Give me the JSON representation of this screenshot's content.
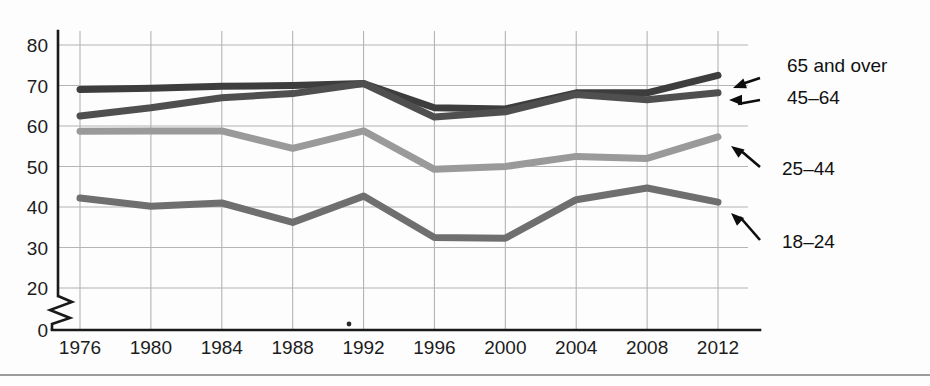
{
  "figure": {
    "background_color": "#fdfdfd",
    "bottom_rule_color": "#7b7b7b"
  },
  "chart_data": {
    "type": "line",
    "title": "",
    "subtitle": "",
    "xlabel": "",
    "ylabel": "",
    "x": [
      1976,
      1980,
      1984,
      1988,
      1992,
      1996,
      2000,
      2004,
      2008,
      2012
    ],
    "categories": [
      "1976",
      "1980",
      "1984",
      "1988",
      "1992",
      "1996",
      "2000",
      "2004",
      "2008",
      "2012"
    ],
    "xlim": [
      1976,
      2012
    ],
    "ylim": [
      0,
      80
    ],
    "y_ticks": [
      "0",
      "20",
      "30",
      "40",
      "50",
      "60",
      "70",
      "80"
    ],
    "y_tick_values": [
      0,
      20,
      30,
      40,
      50,
      60,
      70,
      80
    ],
    "y_axis_break": true,
    "y_axis_break_between": [
      0,
      20
    ],
    "grid": true,
    "legend_position": "right-annotations",
    "series": [
      {
        "name": "65 and over",
        "label": "65 and over",
        "color": "#3d3d3d",
        "values": [
          69,
          69.3,
          69.8,
          70.0,
          70.5,
          64.5,
          64.2,
          68.2,
          68.2,
          72.5
        ]
      },
      {
        "name": "45-64",
        "label": "45–64",
        "color": "#4f4f4f",
        "values": [
          62.5,
          64.5,
          67,
          68,
          70.5,
          62.2,
          63.5,
          67.8,
          66.5,
          68.2
        ]
      },
      {
        "name": "25-44",
        "label": "25–44",
        "color": "#9a9a9a",
        "values": [
          58.7,
          58.8,
          58.8,
          54.5,
          58.8,
          49.3,
          50,
          52.5,
          52,
          57.3
        ]
      },
      {
        "name": "18-24",
        "label": "18–24",
        "color": "#6f6f6f",
        "values": [
          42.2,
          40.2,
          41,
          36.2,
          42.7,
          32.5,
          32.3,
          41.8,
          44.7,
          41.2
        ]
      }
    ]
  },
  "annotations": [
    {
      "name": "65 and over",
      "text": "65 and over"
    },
    {
      "name": "45-64",
      "text": "45–64"
    },
    {
      "name": "25-44",
      "text": "25–44"
    },
    {
      "name": "18-24",
      "text": "18–24"
    }
  ]
}
